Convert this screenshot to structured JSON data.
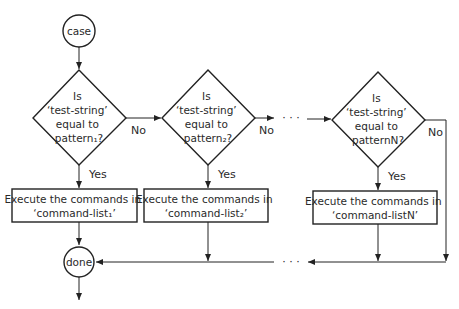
{
  "diagram": {
    "type": "flowchart",
    "start": {
      "label": "case"
    },
    "end": {
      "label": "done"
    },
    "decisions": [
      {
        "lines": [
          "Is",
          "‘test-string’",
          "equal to",
          "pattern₁?"
        ],
        "no_label": "No",
        "yes_label": "Yes"
      },
      {
        "lines": [
          "Is",
          "‘test-string’",
          "equal to",
          "pattern₂?"
        ],
        "no_label": "No",
        "yes_label": "Yes"
      },
      {
        "lines": [
          "Is",
          "‘test-string’",
          "equal to",
          "patternN?"
        ],
        "no_label": "No",
        "yes_label": "Yes"
      }
    ],
    "actions": [
      {
        "lines": [
          "Execute the commands in",
          "‘command-list₁’"
        ]
      },
      {
        "lines": [
          "Execute the commands in",
          "‘command-list₂’"
        ]
      },
      {
        "lines": [
          "Execute the commands in",
          "‘command-listN’"
        ]
      }
    ],
    "ellipsis": "· · ·",
    "colors": {
      "stroke": "#222222",
      "background": "#ffffff"
    }
  }
}
